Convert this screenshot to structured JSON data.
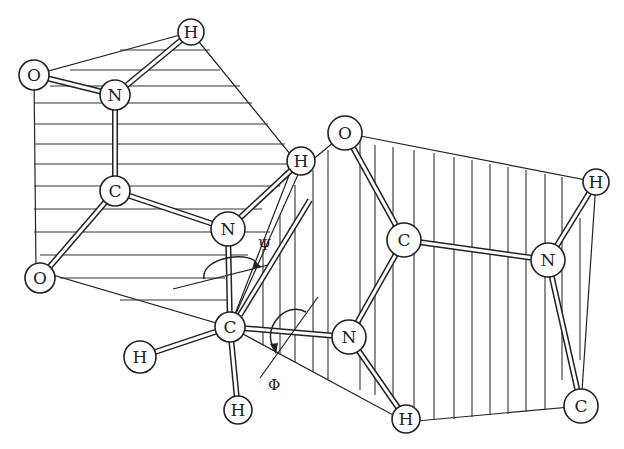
{
  "diagram": {
    "type": "peptide-backbone",
    "atoms": [
      {
        "id": "h1",
        "element": "H",
        "x": 191,
        "y": 32
      },
      {
        "id": "o1",
        "element": "O",
        "x": 34,
        "y": 75
      },
      {
        "id": "n1",
        "element": "N",
        "x": 115,
        "y": 95
      },
      {
        "id": "c1",
        "element": "C",
        "x": 115,
        "y": 191
      },
      {
        "id": "o2",
        "element": "O",
        "x": 40,
        "y": 278
      },
      {
        "id": "h2",
        "element": "H",
        "x": 301,
        "y": 161
      },
      {
        "id": "n2",
        "element": "N",
        "x": 228,
        "y": 229
      },
      {
        "id": "ca",
        "element": "C",
        "x": 230,
        "y": 327
      },
      {
        "id": "h3",
        "element": "H",
        "x": 140,
        "y": 357
      },
      {
        "id": "h4",
        "element": "H",
        "x": 238,
        "y": 410
      },
      {
        "id": "o3",
        "element": "O",
        "x": 345,
        "y": 133
      },
      {
        "id": "c2",
        "element": "C",
        "x": 404,
        "y": 240
      },
      {
        "id": "n3",
        "element": "N",
        "x": 349,
        "y": 337
      },
      {
        "id": "h5",
        "element": "H",
        "x": 406,
        "y": 419
      },
      {
        "id": "n4",
        "element": "N",
        "x": 548,
        "y": 260
      },
      {
        "id": "h6",
        "element": "H",
        "x": 596,
        "y": 182
      },
      {
        "id": "c3",
        "element": "C",
        "x": 581,
        "y": 406
      }
    ],
    "angle_labels": {
      "psi": "Ψ",
      "phi": "Φ"
    }
  }
}
